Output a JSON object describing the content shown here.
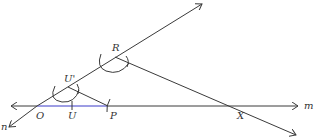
{
  "diagram": {
    "type": "geometric-construction",
    "colors": {
      "line": "#3a3a3a",
      "highlight": "#3b3bc8",
      "label": "#333333",
      "background": "#ffffff"
    },
    "lines": {
      "m": {
        "label": "m"
      },
      "n": {
        "label": "n"
      }
    },
    "points": {
      "O": {
        "label": "O"
      },
      "U": {
        "label": "U"
      },
      "P": {
        "label": "P"
      },
      "U_prime": {
        "label": "U'"
      },
      "R": {
        "label": "R"
      },
      "X": {
        "label": "X"
      }
    }
  }
}
